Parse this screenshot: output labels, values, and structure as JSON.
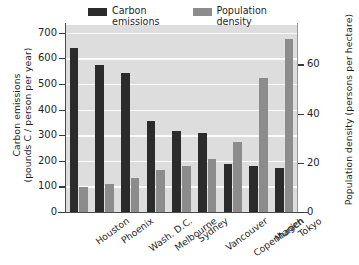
{
  "chart_data": {
    "type": "bar",
    "title": "",
    "categories": [
      "Houston",
      "Phoenix",
      "Wash. D.C.",
      "Melbourne",
      "Sydney",
      "Vancouver",
      "Copenhagen",
      "Munich",
      "Tokyo"
    ],
    "series": [
      {
        "name": "Carbon emissions",
        "axis": "left",
        "color": "#2b2b2b",
        "values": [
          641,
          573,
          543,
          357,
          317,
          309,
          188,
          180,
          170
        ]
      },
      {
        "name": "Population density",
        "axis": "right",
        "color": "#8c8c8c",
        "values": [
          10,
          11.5,
          14,
          17,
          18.5,
          21.5,
          28.5,
          54.5,
          70.5
        ]
      }
    ],
    "xlabel": "",
    "ylabel": "Carbon emissions (pounds C / person per year)",
    "ylabel_right": "Population density (persons per hectare)",
    "ylim": [
      0,
      730
    ],
    "ylim_right": [
      0,
      76
    ],
    "yticks": [
      0,
      100,
      200,
      300,
      400,
      500,
      600,
      700
    ],
    "yticks_right": [
      0,
      20,
      40,
      60
    ],
    "grid": true,
    "legend_position": "top"
  },
  "axes": {
    "left_title_line1": "Carbon emissions",
    "left_title_line2": "(pounds C / person per year)",
    "right_title": "Population density (persons per hectare)"
  },
  "legend": {
    "entries": [
      {
        "label_line1": "Carbon",
        "label_line2": "emissions",
        "color": "#2b2b2b"
      },
      {
        "label_line1": "Population",
        "label_line2": "density",
        "color": "#8c8c8c"
      }
    ]
  },
  "colors": {
    "carbon": "#2b2b2b",
    "density": "#8c8c8c",
    "plot_background": "#dddddd",
    "gridline": "#fbfbfb",
    "axis": "#3a3a3a",
    "text": "#1f1f1f",
    "page_background": "#ffffff"
  }
}
